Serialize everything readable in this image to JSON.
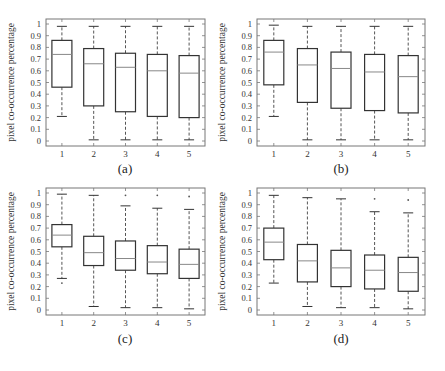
{
  "chart_data": [
    {
      "type": "boxplot",
      "panel": "(a)",
      "xlabel": "number of users",
      "ylabel": "pixel co-occurrence percentage",
      "categories": [
        "1",
        "2",
        "3",
        "4",
        "5"
      ],
      "ylim": [
        0,
        1
      ],
      "yticks": [
        "0",
        "0.1",
        "0.2",
        "0.3",
        "0.4",
        "0.5",
        "0.6",
        "0.7",
        "0.8",
        "0.9",
        "1"
      ],
      "boxes": [
        {
          "whisker_low": 0.21,
          "q1": 0.46,
          "median": 0.74,
          "q3": 0.86,
          "whisker_high": 0.98,
          "outliers": []
        },
        {
          "whisker_low": 0.01,
          "q1": 0.3,
          "median": 0.66,
          "q3": 0.79,
          "whisker_high": 0.98,
          "outliers": []
        },
        {
          "whisker_low": 0.01,
          "q1": 0.25,
          "median": 0.63,
          "q3": 0.75,
          "whisker_high": 0.98,
          "outliers": []
        },
        {
          "whisker_low": 0.01,
          "q1": 0.21,
          "median": 0.6,
          "q3": 0.74,
          "whisker_high": 0.98,
          "outliers": []
        },
        {
          "whisker_low": 0.01,
          "q1": 0.2,
          "median": 0.58,
          "q3": 0.73,
          "whisker_high": 0.98,
          "outliers": []
        }
      ]
    },
    {
      "type": "boxplot",
      "panel": "(b)",
      "xlabel": "number of users",
      "ylabel": "pixel co-occurrence percentage",
      "categories": [
        "1",
        "2",
        "3",
        "4",
        "5"
      ],
      "ylim": [
        0,
        1
      ],
      "yticks": [
        "0",
        "0.1",
        "0.2",
        "0.3",
        "0.4",
        "0.5",
        "0.6",
        "0.7",
        "0.8",
        "0.9",
        "1"
      ],
      "boxes": [
        {
          "whisker_low": 0.21,
          "q1": 0.48,
          "median": 0.76,
          "q3": 0.86,
          "whisker_high": 0.99,
          "outliers": []
        },
        {
          "whisker_low": 0.01,
          "q1": 0.33,
          "median": 0.65,
          "q3": 0.79,
          "whisker_high": 0.98,
          "outliers": []
        },
        {
          "whisker_low": 0.01,
          "q1": 0.28,
          "median": 0.62,
          "q3": 0.76,
          "whisker_high": 0.98,
          "outliers": []
        },
        {
          "whisker_low": 0.01,
          "q1": 0.26,
          "median": 0.59,
          "q3": 0.74,
          "whisker_high": 0.98,
          "outliers": []
        },
        {
          "whisker_low": 0.01,
          "q1": 0.24,
          "median": 0.55,
          "q3": 0.73,
          "whisker_high": 0.98,
          "outliers": []
        }
      ]
    },
    {
      "type": "boxplot",
      "panel": "(c)",
      "xlabel": "number of users",
      "ylabel": "pixel co-occurrence percentage",
      "categories": [
        "1",
        "2",
        "3",
        "4",
        "5"
      ],
      "ylim": [
        0,
        1
      ],
      "yticks": [
        "0",
        "0.1",
        "0.2",
        "0.3",
        "0.4",
        "0.5",
        "0.6",
        "0.7",
        "0.8",
        "0.9",
        "1"
      ],
      "boxes": [
        {
          "whisker_low": 0.27,
          "q1": 0.54,
          "median": 0.64,
          "q3": 0.73,
          "whisker_high": 0.99,
          "outliers": [
            0.23
          ]
        },
        {
          "whisker_low": 0.03,
          "q1": 0.38,
          "median": 0.49,
          "q3": 0.63,
          "whisker_high": 0.98,
          "outliers": []
        },
        {
          "whisker_low": 0.02,
          "q1": 0.34,
          "median": 0.44,
          "q3": 0.59,
          "whisker_high": 0.89,
          "outliers": [
            0.98
          ]
        },
        {
          "whisker_low": 0.02,
          "q1": 0.31,
          "median": 0.41,
          "q3": 0.55,
          "whisker_high": 0.87,
          "outliers": [
            0.98
          ]
        },
        {
          "whisker_low": 0.01,
          "q1": 0.27,
          "median": 0.39,
          "q3": 0.52,
          "whisker_high": 0.86,
          "outliers": [
            0.97
          ]
        }
      ]
    },
    {
      "type": "boxplot",
      "panel": "(d)",
      "xlabel": "number of users",
      "ylabel": "pixel co-occurrence percentage",
      "categories": [
        "1",
        "2",
        "3",
        "4",
        "5"
      ],
      "ylim": [
        0,
        1
      ],
      "yticks": [
        "0",
        "0.1",
        "0.2",
        "0.3",
        "0.4",
        "0.5",
        "0.6",
        "0.7",
        "0.8",
        "0.9",
        "1"
      ],
      "boxes": [
        {
          "whisker_low": 0.23,
          "q1": 0.43,
          "median": 0.58,
          "q3": 0.7,
          "whisker_high": 0.98,
          "outliers": []
        },
        {
          "whisker_low": 0.03,
          "q1": 0.24,
          "median": 0.42,
          "q3": 0.56,
          "whisker_high": 0.96,
          "outliers": []
        },
        {
          "whisker_low": 0.02,
          "q1": 0.2,
          "median": 0.36,
          "q3": 0.51,
          "whisker_high": 0.95,
          "outliers": []
        },
        {
          "whisker_low": 0.02,
          "q1": 0.18,
          "median": 0.34,
          "q3": 0.47,
          "whisker_high": 0.84,
          "outliers": [
            0.95
          ]
        },
        {
          "whisker_low": 0.01,
          "q1": 0.16,
          "median": 0.32,
          "q3": 0.45,
          "whisker_high": 0.83,
          "outliers": [
            0.94
          ]
        }
      ]
    }
  ],
  "captions": [
    "(a)",
    "(b)",
    "(c)",
    "(d)"
  ],
  "colors": {
    "box": "#333333",
    "median": "#888888",
    "whisker": "#555555",
    "frame": "#777777",
    "text": "#333333"
  }
}
